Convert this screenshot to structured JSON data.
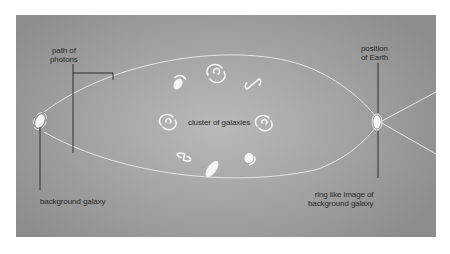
{
  "diagram": {
    "labels": {
      "path_of_photons": [
        "path of",
        "photons"
      ],
      "position_of_earth": [
        "position",
        "of Earth"
      ],
      "cluster_of_galaxies": "cluster of galaxies",
      "background_galaxy": "background galaxy",
      "ring_image": [
        "ring like image of",
        "background galaxy"
      ]
    },
    "colors": {
      "background_outer": "#8d8d8d",
      "background_center": "#b9b9b9",
      "photon_path": "#e6e6e6",
      "galaxy": "#f5f5f5",
      "leader_line": "#222222",
      "text": "#2a2a2a"
    },
    "galaxy_count_in_cluster": 8
  }
}
